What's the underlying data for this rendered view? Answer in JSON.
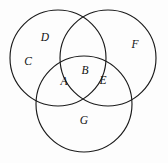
{
  "figure": {
    "kind": "venn-diagram",
    "width": 168,
    "height": 163,
    "background_color": "#fdfdfd",
    "stroke_color": "#1a1a1a",
    "stroke_width": 1.15
  },
  "circles": [
    {
      "name": "upper-left-circle",
      "cx": 58,
      "cy": 58,
      "r": 48
    },
    {
      "name": "upper-right-circle",
      "cx": 108,
      "cy": 58,
      "r": 48
    },
    {
      "name": "bottom-circle",
      "cx": 84,
      "cy": 104,
      "r": 48
    }
  ],
  "labels": [
    {
      "id": "A",
      "text": "A",
      "x": 64,
      "y": 82
    },
    {
      "id": "B",
      "text": "B",
      "x": 85,
      "y": 71
    },
    {
      "id": "C",
      "text": "C",
      "x": 28,
      "y": 62
    },
    {
      "id": "D",
      "text": "D",
      "x": 45,
      "y": 38
    },
    {
      "id": "E",
      "text": "E",
      "x": 103,
      "y": 81
    },
    {
      "id": "F",
      "text": "F",
      "x": 135,
      "y": 45
    },
    {
      "id": "G",
      "text": "G",
      "x": 84,
      "y": 121
    }
  ],
  "chart_data": {
    "type": "diagram",
    "subtype": "venn",
    "title": "",
    "set_count": 3,
    "sets": [
      {
        "name": "upper-left-circle",
        "cx": 58,
        "cy": 58,
        "r": 48
      },
      {
        "name": "upper-right-circle",
        "cx": 108,
        "cy": 58,
        "r": 48
      },
      {
        "name": "bottom-circle",
        "cx": 84,
        "cy": 104,
        "r": 48
      }
    ],
    "region_labels": [
      "A",
      "B",
      "C",
      "D",
      "E",
      "F",
      "G"
    ],
    "regions": [
      {
        "label": "C",
        "description": "upper-left-circle only (left portion)"
      },
      {
        "label": "D",
        "description": "upper-left-circle only (upper portion)"
      },
      {
        "label": "F",
        "description": "upper-right-circle only"
      },
      {
        "label": "G",
        "description": "bottom-circle only"
      },
      {
        "label": "A",
        "description": "upper-left-circle and bottom-circle"
      },
      {
        "label": "B",
        "description": "upper-left-circle, upper-right-circle and bottom-circle"
      },
      {
        "label": "E",
        "description": "upper-right-circle and bottom-circle"
      }
    ],
    "legend": [],
    "grid": false
  }
}
